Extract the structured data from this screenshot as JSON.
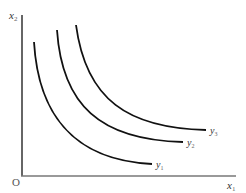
{
  "diagram": {
    "type": "indifference-curves",
    "axes": {
      "y_label": "x",
      "y_label_sub": "2",
      "x_label": "x",
      "x_label_sub": "1",
      "origin_label": "O"
    },
    "curves": [
      {
        "label": "y",
        "sub": "1"
      },
      {
        "label": "y",
        "sub": "2"
      },
      {
        "label": "y",
        "sub": "3"
      }
    ],
    "colors": {
      "axis": "#555555",
      "curve": "#111111",
      "label": "#333333"
    }
  }
}
